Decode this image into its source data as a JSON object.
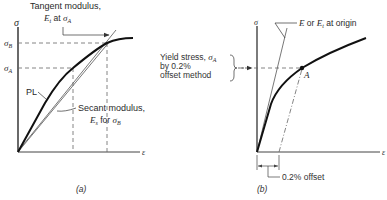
{
  "figure": {
    "panels": [
      {
        "id": "a",
        "caption": "(a)",
        "y_axis_label": "σ",
        "x_axis_label": "ε",
        "stress_levels": [
          {
            "symbol": "σ",
            "subscript": "B"
          },
          {
            "symbol": "σ",
            "subscript": "A"
          }
        ],
        "annotations": {
          "tangent_line1": "Tangent modulus,",
          "tangent_line2_prefix": "E",
          "tangent_line2_sub": "t",
          "tangent_line2_mid": " at ",
          "tangent_line2_sym": "σ",
          "tangent_line2_sym_sub": "A",
          "pl": "PL",
          "secant_line1": "Secant modulus,",
          "secant_line2_prefix": "E",
          "secant_line2_sub": "s",
          "secant_line2_mid": " for ",
          "secant_line2_sym": "σ",
          "secant_line2_sym_sub": "B"
        }
      },
      {
        "id": "b",
        "caption": "(b)",
        "y_axis_label": "σ",
        "x_axis_label": "ε",
        "point_label": "A",
        "annotations": {
          "modulus_prefix": "E",
          "modulus_mid": " or ",
          "modulus_E": "E",
          "modulus_sub": "t",
          "modulus_suffix": " at origin",
          "yield_line1": "Yield stress, ",
          "yield_sym": "σ",
          "yield_sym_sub": "A",
          "yield_line2": "by 0.2%",
          "yield_line3": "offset method",
          "offset": "0.2% offset"
        }
      }
    ]
  }
}
